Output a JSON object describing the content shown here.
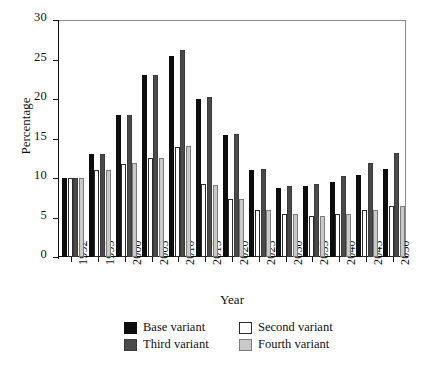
{
  "chart_data": {
    "type": "bar",
    "title": "",
    "xlabel": "Year",
    "ylabel": "Percentage",
    "ylim": [
      0,
      30
    ],
    "yticks": [
      0,
      5,
      10,
      15,
      20,
      25,
      30
    ],
    "grid": false,
    "legend_position": "bottom",
    "categories": [
      "1992",
      "1995",
      "2000",
      "2005",
      "2010",
      "2015",
      "2020",
      "2025",
      "2030",
      "2035",
      "2040",
      "2045",
      "2050"
    ],
    "series": [
      {
        "name": "Base variant",
        "color": "#0d0d0d",
        "values": [
          10.0,
          13.0,
          18.0,
          23.0,
          25.5,
          20.0,
          15.5,
          11.0,
          8.7,
          9.0,
          9.5,
          10.4,
          11.2
        ]
      },
      {
        "name": "Second variant",
        "color": "#ffffff",
        "values": [
          10.0,
          11.0,
          11.8,
          12.5,
          13.9,
          9.2,
          7.3,
          6.0,
          5.4,
          5.2,
          5.4,
          5.9,
          6.5
        ]
      },
      {
        "name": "Third variant",
        "color": "#4a4a4a",
        "values": [
          10.0,
          13.0,
          18.0,
          23.0,
          26.2,
          20.3,
          15.6,
          11.1,
          9.0,
          9.2,
          10.2,
          11.9,
          13.2
        ]
      },
      {
        "name": "Fourth variant",
        "color": "#c9c9c9",
        "values": [
          10.0,
          11.0,
          11.9,
          12.5,
          14.0,
          9.1,
          7.3,
          6.0,
          5.4,
          5.2,
          5.5,
          5.9,
          6.5
        ]
      }
    ]
  },
  "legend": {
    "items": [
      {
        "label": "Base variant",
        "variant": "v0"
      },
      {
        "label": "Second variant",
        "variant": "v1"
      },
      {
        "label": "Third variant",
        "variant": "v2"
      },
      {
        "label": "Fourth variant",
        "variant": "v3"
      }
    ]
  },
  "axes": {
    "y_title": "Percentage",
    "x_title": "Year"
  }
}
